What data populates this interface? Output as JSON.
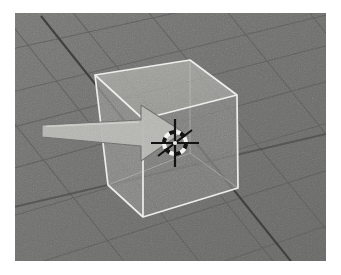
{
  "app": {
    "name": "Blender 3D Viewport",
    "view_label": "User Perspective"
  },
  "viewport": {
    "background_color": "#6e6e6e",
    "grid_line_color": "#5d5d5d",
    "axis_line_color": "#3a3a3a",
    "frame_color": "#ffffff",
    "width": 311,
    "height": 248
  },
  "objects": [
    {
      "name": "cube",
      "label": "Cube",
      "type": "mesh",
      "selected": true,
      "outline_color": "#f0f0ee",
      "top_face_color": "#a9a9a5",
      "left_face_color": "#8e8e8b",
      "right_face_color": "#828280",
      "opacity": 0.72
    }
  ],
  "cursor_3d": {
    "name": "3d-cursor",
    "label": "3D Cursor",
    "x": 160,
    "y": 130,
    "color_dark": "#111111",
    "color_light": "#f2f2f2"
  },
  "mouse_pointer": {
    "name": "mouse-pointer",
    "label": "Mouse Pointer",
    "x": 42,
    "y": 113,
    "direction": "right",
    "fill_color": "#b4b4b0",
    "edge_color": "#6a6a68"
  },
  "icons": {
    "cursor_3d_icon": "3d-cursor-icon",
    "pointer_icon": "mouse-pointer-icon",
    "cube_icon": "cube-icon",
    "grid_icon": "grid-floor-icon"
  },
  "chart_data": null
}
